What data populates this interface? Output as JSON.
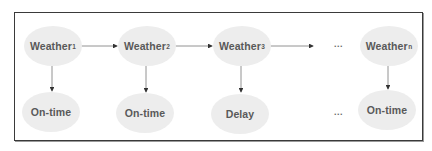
{
  "diagram": {
    "type": "chain-model",
    "states": [
      {
        "label": "Weather",
        "subscript": "1"
      },
      {
        "label": "Weather",
        "subscript": "2"
      },
      {
        "label": "Weather",
        "subscript": "3"
      },
      {
        "label": "Weather",
        "subscript": "n"
      }
    ],
    "observations": [
      {
        "label": "On-time"
      },
      {
        "label": "On-time"
      },
      {
        "label": "Delay"
      },
      {
        "label": "On-time"
      }
    ],
    "ellipsis_top": "...",
    "ellipsis_bottom": "...",
    "colors": {
      "node_fill": "#ededed",
      "text": "#595959",
      "edge": "#555555",
      "border": "#3a3a3a"
    }
  }
}
